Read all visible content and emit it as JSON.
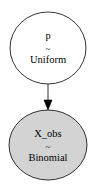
{
  "graph": {
    "nodes": [
      {
        "id": "p",
        "name": "p",
        "dist_symbol": "~",
        "distribution": "Uniform",
        "observed": false,
        "fill": "#ffffff"
      },
      {
        "id": "X_obs",
        "name": "X_obs",
        "dist_symbol": "~",
        "distribution": "Binomial",
        "observed": true,
        "fill": "#d3d3d3"
      }
    ],
    "edges": [
      {
        "from": "p",
        "to": "X_obs"
      }
    ]
  }
}
